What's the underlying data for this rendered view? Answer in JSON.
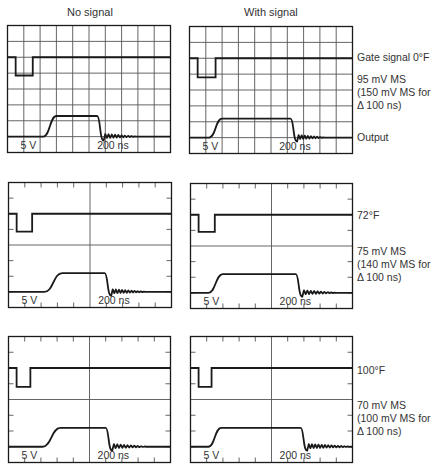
{
  "columns": [
    {
      "title": "No signal"
    },
    {
      "title": "With signal"
    }
  ],
  "scale": {
    "volts_per_div": "5 V",
    "time_per_div": "200 ns"
  },
  "rows": [
    {
      "grid_style": "full",
      "temp_label": "Gate signal 0°F",
      "noise_lines": [
        "95 mV MS",
        "(150 mV MS for",
        "Δ 100 ns)"
      ],
      "output_label": "Output",
      "panels": [
        {
          "gate_high": 2.0,
          "gate_low": 3.15,
          "gate_start": 0.5,
          "gate_end": 1.55,
          "out_base": 7.0,
          "out_high": 5.7,
          "rise_start": 2.2,
          "rise_end": 3.0,
          "fall_start": 5.5,
          "fall_end": 5.9,
          "ring_end": 7.9,
          "out_end": 10
        },
        {
          "gate_high": 2.0,
          "gate_low": 3.2,
          "gate_start": 0.5,
          "gate_end": 1.6,
          "out_base": 7.0,
          "out_high": 5.8,
          "rise_start": 1.2,
          "rise_end": 2.0,
          "fall_start": 6.2,
          "fall_end": 6.6,
          "ring_end": 8.3,
          "out_end": 10
        }
      ]
    },
    {
      "grid_style": "cross",
      "temp_label": "72°F",
      "noise_lines": [
        "75 mV MS",
        "(140 mV MS for",
        "Δ 100 ns)"
      ],
      "output_label": "",
      "panels": [
        {
          "gate_high": 2.0,
          "gate_low": 3.15,
          "gate_start": 0.5,
          "gate_end": 1.45,
          "out_base": 7.0,
          "out_high": 5.8,
          "rise_start": 2.2,
          "rise_end": 3.3,
          "fall_start": 5.9,
          "fall_end": 6.3,
          "ring_end": 8.4,
          "out_end": 10
        },
        {
          "gate_high": 2.0,
          "gate_low": 3.1,
          "gate_start": 0.5,
          "gate_end": 1.5,
          "out_base": 7.0,
          "out_high": 5.8,
          "rise_start": 1.1,
          "rise_end": 2.0,
          "fall_start": 6.5,
          "fall_end": 6.9,
          "ring_end": 9.0,
          "out_end": 10
        }
      ]
    },
    {
      "grid_style": "cross",
      "temp_label": "100°F",
      "noise_lines": [
        "70 mV MS",
        "(100 mV MS for",
        "Δ 100 ns)"
      ],
      "output_label": "",
      "panels": [
        {
          "gate_high": 2.0,
          "gate_low": 3.2,
          "gate_start": 0.5,
          "gate_end": 1.35,
          "out_base": 7.0,
          "out_high": 5.8,
          "rise_start": 2.1,
          "rise_end": 3.2,
          "fall_start": 6.0,
          "fall_end": 6.4,
          "ring_end": 8.5,
          "out_end": 10
        },
        {
          "gate_high": 2.0,
          "gate_low": 3.2,
          "gate_start": 0.5,
          "gate_end": 1.3,
          "out_base": 7.0,
          "out_high": 5.8,
          "rise_start": 1.1,
          "rise_end": 1.9,
          "fall_start": 6.8,
          "fall_end": 7.2,
          "ring_end": 10,
          "out_end": 10
        }
      ]
    }
  ]
}
